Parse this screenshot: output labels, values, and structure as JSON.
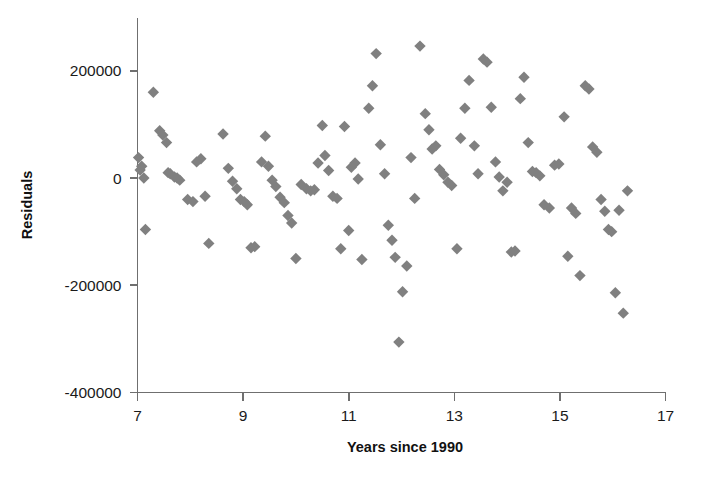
{
  "chart_data": {
    "type": "scatter",
    "title": "",
    "xlabel": "Years since 1990",
    "ylabel": "Residuals",
    "xlim": [
      7,
      17
    ],
    "ylim": [
      -400000,
      250000
    ],
    "xticks": [
      7,
      9,
      11,
      13,
      15,
      17
    ],
    "xtick_labels": [
      "7",
      "9",
      "11",
      "13",
      "15",
      "17"
    ],
    "yticks": [
      -400000,
      -200000,
      0,
      200000
    ],
    "ytick_labels": [
      "-400000",
      "-200000",
      "0",
      "200000"
    ],
    "grid": false,
    "legend": null,
    "marker": "diamond",
    "marker_color": "#808080",
    "marker_size": 9,
    "series": [
      {
        "name": "Residuals",
        "points": [
          [
            7.02,
            38000
          ],
          [
            7.05,
            15000
          ],
          [
            7.08,
            22000
          ],
          [
            7.12,
            0
          ],
          [
            7.15,
            -96000
          ],
          [
            7.3,
            160000
          ],
          [
            7.42,
            88000
          ],
          [
            7.48,
            80000
          ],
          [
            7.55,
            66000
          ],
          [
            7.58,
            10000
          ],
          [
            7.62,
            8000
          ],
          [
            7.7,
            2000
          ],
          [
            7.75,
            0
          ],
          [
            7.8,
            -4000
          ],
          [
            7.95,
            -40000
          ],
          [
            8.05,
            -44000
          ],
          [
            8.12,
            30000
          ],
          [
            8.2,
            36000
          ],
          [
            8.28,
            -34000
          ],
          [
            8.35,
            -122000
          ],
          [
            8.62,
            82000
          ],
          [
            8.72,
            18000
          ],
          [
            8.8,
            -6000
          ],
          [
            8.88,
            -20000
          ],
          [
            8.95,
            -40000
          ],
          [
            9.02,
            -44000
          ],
          [
            9.08,
            -50000
          ],
          [
            9.15,
            -130000
          ],
          [
            9.22,
            -128000
          ],
          [
            9.35,
            30000
          ],
          [
            9.42,
            78000
          ],
          [
            9.48,
            22000
          ],
          [
            9.55,
            -4000
          ],
          [
            9.62,
            -16000
          ],
          [
            9.7,
            -36000
          ],
          [
            9.78,
            -46000
          ],
          [
            9.85,
            -70000
          ],
          [
            9.92,
            -84000
          ],
          [
            10.0,
            -150000
          ],
          [
            10.1,
            -12000
          ],
          [
            10.2,
            -20000
          ],
          [
            10.28,
            -24000
          ],
          [
            10.35,
            -22000
          ],
          [
            10.42,
            28000
          ],
          [
            10.5,
            98000
          ],
          [
            10.55,
            42000
          ],
          [
            10.62,
            14000
          ],
          [
            10.7,
            -34000
          ],
          [
            10.78,
            -38000
          ],
          [
            10.85,
            -132000
          ],
          [
            10.92,
            96000
          ],
          [
            11.0,
            -98000
          ],
          [
            11.05,
            20000
          ],
          [
            11.12,
            28000
          ],
          [
            11.18,
            -2000
          ],
          [
            11.25,
            -152000
          ],
          [
            11.38,
            130000
          ],
          [
            11.45,
            172000
          ],
          [
            11.52,
            232000
          ],
          [
            11.6,
            62000
          ],
          [
            11.68,
            8000
          ],
          [
            11.75,
            -88000
          ],
          [
            11.82,
            -116000
          ],
          [
            11.88,
            -148000
          ],
          [
            11.95,
            -306000
          ],
          [
            12.02,
            -212000
          ],
          [
            12.1,
            -164000
          ],
          [
            12.18,
            38000
          ],
          [
            12.25,
            -38000
          ],
          [
            12.35,
            246000
          ],
          [
            12.45,
            120000
          ],
          [
            12.52,
            90000
          ],
          [
            12.58,
            54000
          ],
          [
            12.65,
            60000
          ],
          [
            12.72,
            16000
          ],
          [
            12.8,
            6000
          ],
          [
            12.88,
            -8000
          ],
          [
            12.95,
            -14000
          ],
          [
            13.05,
            -132000
          ],
          [
            13.12,
            74000
          ],
          [
            13.2,
            130000
          ],
          [
            13.28,
            182000
          ],
          [
            13.38,
            60000
          ],
          [
            13.45,
            8000
          ],
          [
            13.55,
            222000
          ],
          [
            13.62,
            216000
          ],
          [
            13.7,
            132000
          ],
          [
            13.78,
            30000
          ],
          [
            13.85,
            2000
          ],
          [
            13.92,
            -24000
          ],
          [
            14.0,
            -8000
          ],
          [
            14.08,
            -138000
          ],
          [
            14.15,
            -136000
          ],
          [
            14.25,
            148000
          ],
          [
            14.32,
            188000
          ],
          [
            14.4,
            66000
          ],
          [
            14.48,
            12000
          ],
          [
            14.55,
            10000
          ],
          [
            14.62,
            4000
          ],
          [
            14.7,
            -50000
          ],
          [
            14.8,
            -56000
          ],
          [
            14.9,
            24000
          ],
          [
            14.98,
            26000
          ],
          [
            15.08,
            114000
          ],
          [
            15.15,
            -146000
          ],
          [
            15.22,
            -56000
          ],
          [
            15.3,
            -66000
          ],
          [
            15.38,
            -182000
          ],
          [
            15.48,
            172000
          ],
          [
            15.55,
            166000
          ],
          [
            15.62,
            58000
          ],
          [
            15.7,
            48000
          ],
          [
            15.78,
            -40000
          ],
          [
            15.85,
            -62000
          ],
          [
            15.92,
            -96000
          ],
          [
            15.98,
            -100000
          ],
          [
            16.05,
            -214000
          ],
          [
            16.12,
            -60000
          ],
          [
            16.2,
            -252000
          ],
          [
            16.28,
            -24000
          ]
        ]
      }
    ]
  },
  "axes": {
    "origin_px": {
      "x": 137,
      "y": 392
    },
    "x_right_px": 665,
    "y_top_px": 18
  }
}
